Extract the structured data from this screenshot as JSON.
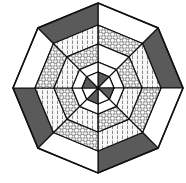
{
  "diagram": {
    "shape": "octagon",
    "center": [
      98,
      88
    ],
    "ring_radii": [
      85,
      63,
      44,
      26,
      16
    ],
    "sector_count": 8,
    "colors": {
      "stroke": "#111111",
      "dark": "#5a5a5a",
      "white": "#ffffff",
      "pattern_bg": "#f4f4f4",
      "pattern_ink": "#8a8a8a"
    },
    "rings": [
      {
        "name": "outer-ring",
        "fills": [
          "white",
          "dark",
          "white",
          "dark",
          "white",
          "dark",
          "white",
          "dark"
        ]
      },
      {
        "name": "second-ring",
        "fills": [
          "dotted",
          "hatched",
          "dotted",
          "hatched",
          "dotted",
          "hatched",
          "dotted",
          "hatched"
        ]
      },
      {
        "name": "third-ring",
        "fills": [
          "white",
          "dotted",
          "hatched",
          "dotted",
          "hatched",
          "dotted",
          "hatched",
          "dotted"
        ]
      },
      {
        "name": "fourth-ring",
        "fills": [
          "white",
          "white",
          "white",
          "white",
          "white",
          "white",
          "white",
          "white"
        ]
      },
      {
        "name": "center-ring",
        "fills": [
          "dark",
          "white",
          "dark",
          "white",
          "dark",
          "white",
          "dark",
          "white"
        ]
      }
    ]
  }
}
